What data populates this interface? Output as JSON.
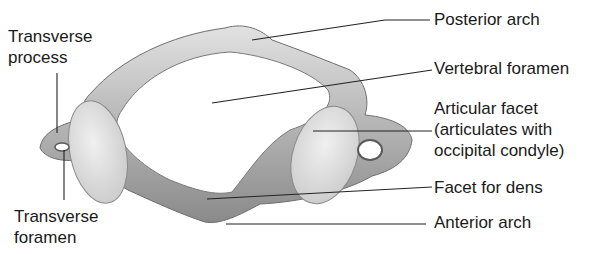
{
  "figure": {
    "labels": {
      "posterior_arch": "Posterior arch",
      "vertebral_foramen": "Vertebral foramen",
      "articular_facet_l1": "Articular facet",
      "articular_facet_l2": "(articulates with",
      "articular_facet_l3": "occipital condyle)",
      "facet_for_dens": "Facet for dens",
      "anterior_arch": "Anterior arch",
      "transverse_process_l1": "Transverse",
      "transverse_process_l2": "process",
      "transverse_foramen_l1": "Transverse",
      "transverse_foramen_l2": "foramen"
    },
    "colors": {
      "bone": "#b8b8b8",
      "bone_light": "#dcdcdc",
      "bone_dark": "#7a7a7a",
      "facet": "#e4e4e4",
      "line": "#222222",
      "text": "#1a1a1a"
    }
  }
}
